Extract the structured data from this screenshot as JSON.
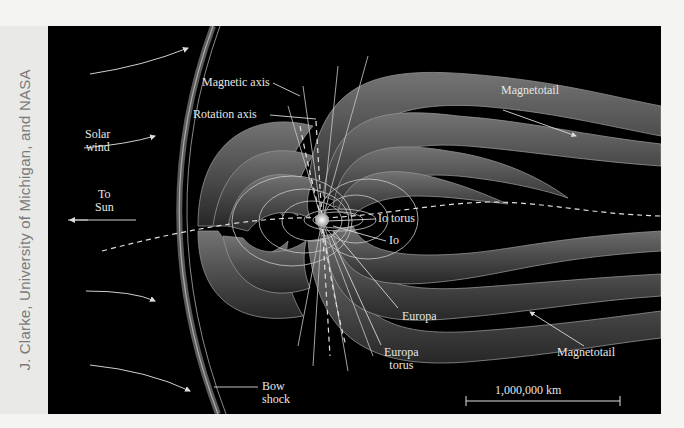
{
  "credit": "J. Clarke, University of Michigan, and NASA",
  "diagram": {
    "background_color": "#000000",
    "field_line_color": "#6a6a6a",
    "labels": {
      "solar_wind": [
        "Solar",
        "wind"
      ],
      "to_sun": [
        "To",
        "Sun"
      ],
      "magnetic_axis": "Magnetic axis",
      "rotation_axis": "Rotation axis",
      "magnetotail_top": "Magnetotail",
      "magnetotail_bottom": "Magnetotail",
      "io_torus": "Io torus",
      "io": "Io",
      "europa": "Europa",
      "europa_torus": [
        "Europa",
        "torus"
      ],
      "bow_shock": [
        "Bow",
        "shock"
      ],
      "scale_bar": "1,000,000 km"
    }
  }
}
